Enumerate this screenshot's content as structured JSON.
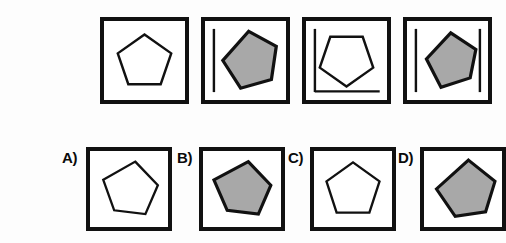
{
  "puzzle": {
    "kind": "visual-analogy-matrix",
    "background_color": "#fdfdfd",
    "frame_color": "#111111",
    "shape_outline_color": "#111111",
    "shape_fill_white": "#ffffff",
    "shape_fill_gray": "#a8a8a8",
    "prompt_row_count": 4,
    "option_row_count": 4
  },
  "prompt": {
    "panels": [
      {
        "id": "prompt-panel-1",
        "position": 1,
        "shape": "pentagon",
        "fill": "white",
        "orientation": "upright",
        "rotation_deg": 0,
        "markers": []
      },
      {
        "id": "prompt-panel-2",
        "position": 2,
        "shape": "pentagon",
        "fill": "gray",
        "orientation": "rotated",
        "rotation_deg": -20,
        "markers": [
          "left-vertical-line"
        ]
      },
      {
        "id": "prompt-panel-3",
        "position": 3,
        "shape": "pentagon",
        "fill": "white",
        "orientation": "inverted",
        "rotation_deg": 180,
        "markers": [
          "left-vertical-line",
          "bottom-horizontal-line"
        ]
      },
      {
        "id": "prompt-panel-4",
        "position": 4,
        "shape": "pentagon",
        "fill": "gray",
        "orientation": "rotated",
        "rotation_deg": -20,
        "markers": [
          "left-vertical-line",
          "right-vertical-line"
        ]
      }
    ]
  },
  "options": {
    "items": [
      {
        "id": "option-a",
        "label": "A)",
        "letter": "A",
        "shape": "pentagon",
        "fill": "white",
        "orientation": "rotated",
        "rotation_deg": -25,
        "markers": []
      },
      {
        "id": "option-b",
        "label": "B)",
        "letter": "B",
        "shape": "pentagon",
        "fill": "gray",
        "orientation": "rotated",
        "rotation_deg": -25,
        "markers": []
      },
      {
        "id": "option-c",
        "label": "C)",
        "letter": "C",
        "shape": "pentagon",
        "fill": "white",
        "orientation": "upright",
        "rotation_deg": 0,
        "markers": []
      },
      {
        "id": "option-d",
        "label": "D)",
        "letter": "D",
        "shape": "pentagon",
        "fill": "gray",
        "orientation": "rotated",
        "rotation_deg": -30,
        "markers": []
      }
    ]
  }
}
